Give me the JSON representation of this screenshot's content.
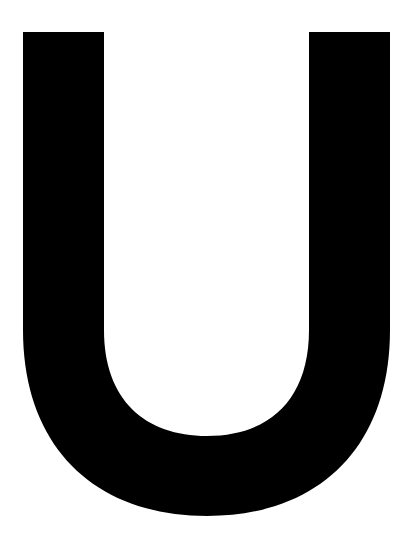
{
  "glyph": {
    "character": "U",
    "color": "#000000",
    "background": "#ffffff"
  }
}
